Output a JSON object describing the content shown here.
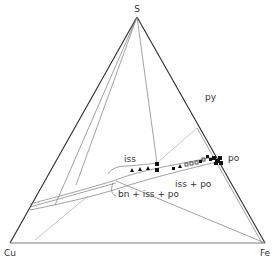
{
  "diagram": {
    "vertices": {
      "top": {
        "label": "S",
        "x": 137,
        "y": 17,
        "lx": 137,
        "ly": 12
      },
      "left": {
        "label": "Cu",
        "x": 10,
        "y": 243,
        "lx": 10,
        "ly": 256
      },
      "right": {
        "label": "Fe",
        "x": 265,
        "y": 243,
        "lx": 265,
        "ly": 256
      }
    },
    "phase_labels": [
      {
        "label": "py",
        "x": 205,
        "y": 100
      },
      {
        "label": "po",
        "x": 233,
        "y": 161
      },
      {
        "label": "iss",
        "x": 124,
        "y": 160
      },
      {
        "label": "iss + po",
        "x": 180,
        "y": 185
      },
      {
        "label": "bn + iss + po",
        "x": 117,
        "y": 196
      }
    ],
    "colors": {
      "edge": "#2a2a2a",
      "line": "#7a7a7a",
      "text": "#333333",
      "marker": "#111111"
    }
  }
}
